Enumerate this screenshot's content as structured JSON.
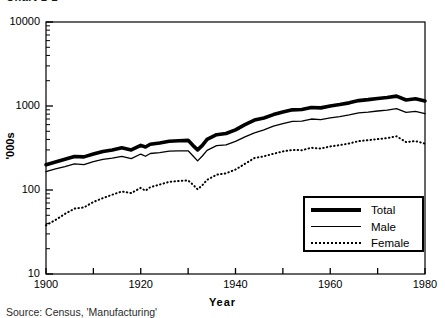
{
  "figure": {
    "top_cut_label": "Chart 1-2",
    "source_note": "Source: Census, 'Manufacturing'"
  },
  "chart_data": {
    "type": "line",
    "title": "",
    "xlabel": "Year",
    "ylabel": "'000s",
    "yscale": "log",
    "ylim": [
      10,
      10000
    ],
    "xlim": [
      1900,
      1980
    ],
    "ytick_labels": [
      "10000",
      "1000",
      "100",
      "10"
    ],
    "ytick_values": [
      10000,
      1000,
      100,
      10
    ],
    "xtick_labels": [
      "1900",
      "1920",
      "1940",
      "1960",
      "1980"
    ],
    "xtick_values": [
      1900,
      1920,
      1940,
      1960,
      1980
    ],
    "xminor_ticks": [
      1910,
      1930,
      1950,
      1970
    ],
    "grid": false,
    "legend_position": "lower-right",
    "x": [
      1900,
      1902,
      1904,
      1906,
      1908,
      1910,
      1912,
      1914,
      1916,
      1918,
      1920,
      1921,
      1922,
      1924,
      1926,
      1928,
      1930,
      1931,
      1932,
      1933,
      1934,
      1936,
      1938,
      1940,
      1942,
      1944,
      1946,
      1948,
      1950,
      1952,
      1954,
      1956,
      1958,
      1960,
      1962,
      1964,
      1966,
      1968,
      1970,
      1972,
      1974,
      1976,
      1978,
      1980
    ],
    "series": [
      {
        "name": "Total",
        "style": "thick-solid",
        "color": "#000000",
        "values": [
          200,
          215,
          232,
          250,
          248,
          268,
          288,
          300,
          318,
          300,
          340,
          325,
          350,
          362,
          380,
          385,
          390,
          340,
          300,
          340,
          400,
          455,
          470,
          520,
          600,
          680,
          720,
          790,
          850,
          900,
          910,
          960,
          950,
          1000,
          1040,
          1090,
          1160,
          1190,
          1230,
          1260,
          1310,
          1180,
          1220,
          1150
        ]
      },
      {
        "name": "Male",
        "style": "thin-solid",
        "color": "#000000",
        "values": [
          165,
          178,
          190,
          205,
          200,
          218,
          232,
          240,
          252,
          236,
          268,
          252,
          272,
          278,
          290,
          292,
          293,
          256,
          222,
          254,
          296,
          338,
          345,
          380,
          430,
          480,
          520,
          575,
          618,
          655,
          660,
          700,
          688,
          722,
          748,
          782,
          828,
          846,
          872,
          892,
          928,
          838,
          862,
          812
        ]
      },
      {
        "name": "Female",
        "style": "dotted",
        "color": "#000000",
        "values": [
          38,
          44,
          52,
          60,
          62,
          72,
          80,
          88,
          96,
          92,
          106,
          98,
          108,
          116,
          125,
          128,
          130,
          116,
          102,
          114,
          132,
          152,
          158,
          175,
          205,
          240,
          252,
          270,
          288,
          300,
          298,
          318,
          312,
          330,
          342,
          358,
          382,
          392,
          404,
          414,
          436,
          372,
          382,
          356
        ]
      }
    ]
  },
  "legend": {
    "items": [
      {
        "label": "Total",
        "style": "thick-solid"
      },
      {
        "label": "Male",
        "style": "thin-solid"
      },
      {
        "label": "Female",
        "style": "dotted"
      }
    ]
  }
}
